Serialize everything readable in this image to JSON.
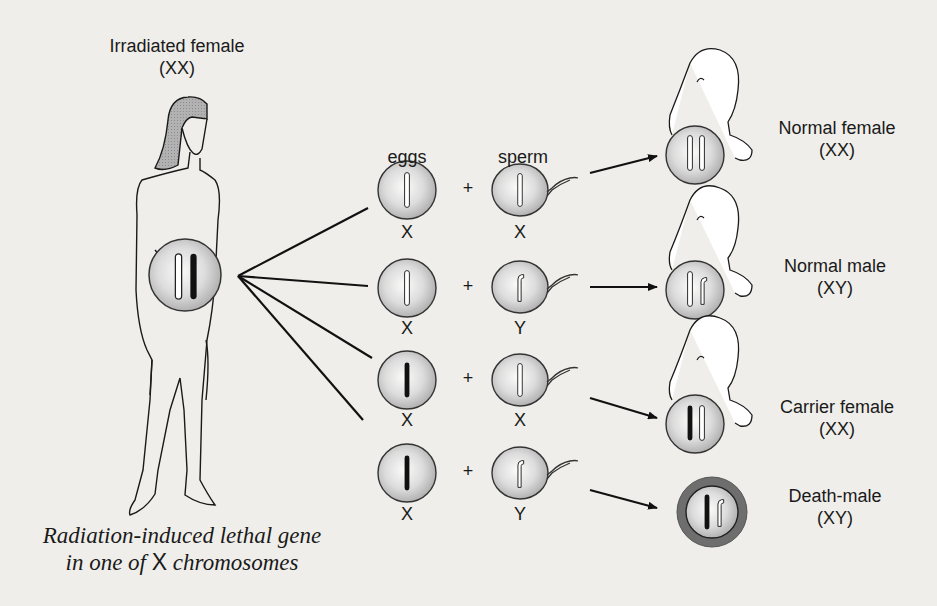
{
  "title": {
    "line1": "Irradiated female",
    "line2": "(XX)"
  },
  "columns": {
    "eggs": "eggs",
    "sperm": "sperm"
  },
  "plus": "+",
  "crosses": [
    {
      "egg": {
        "label": "X",
        "chromosome": "normal-X"
      },
      "sperm": {
        "label": "X",
        "chromosome": "normal-X"
      },
      "outcome": {
        "name": "Normal female",
        "karyotype": "(XX)",
        "state": "embryo"
      }
    },
    {
      "egg": {
        "label": "X",
        "chromosome": "normal-X"
      },
      "sperm": {
        "label": "Y",
        "chromosome": "Y"
      },
      "outcome": {
        "name": "Normal male",
        "karyotype": "(XY)",
        "state": "embryo"
      }
    },
    {
      "egg": {
        "label": "X",
        "chromosome": "lethal-X"
      },
      "sperm": {
        "label": "X",
        "chromosome": "normal-X"
      },
      "outcome": {
        "name": "Carrier female",
        "karyotype": "(XX)",
        "state": "embryo"
      }
    },
    {
      "egg": {
        "label": "X",
        "chromosome": "lethal-X"
      },
      "sperm": {
        "label": "Y",
        "chromosome": "Y"
      },
      "outcome": {
        "name": "Death-male",
        "karyotype": "(XY)",
        "state": "dead"
      }
    }
  ],
  "caption": {
    "line1": "Radiation-induced lethal gene",
    "line2_pre": "in one of ",
    "line2_x": "X",
    "line2_post": " chromosomes"
  },
  "colors": {
    "background": "#efeeea",
    "cell_fill": "#c8c8c8",
    "lethal_chromosome": "#111111",
    "dead_ring": "#6e6e6e",
    "hair": "#a8a8a8"
  }
}
